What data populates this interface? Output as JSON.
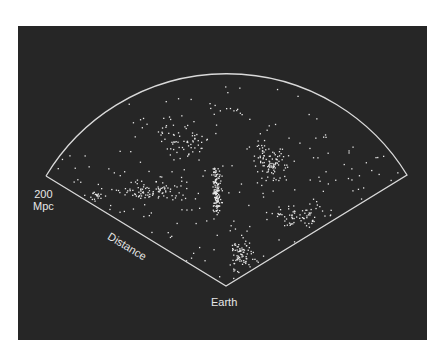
{
  "figure": {
    "background_color": "#262626",
    "outline_color": "#d9d9d9",
    "point_color": "#e8e8e8",
    "labels": {
      "scale_value": "200",
      "scale_unit": "Mpc",
      "axis": "Distance",
      "origin": "Earth"
    },
    "geometry": {
      "apex": [
        226,
        286
      ],
      "left_corner": [
        46,
        176
      ],
      "right_corner": [
        407,
        175
      ],
      "arc_top_y": 68
    },
    "galaxy_distribution": {
      "seed": 12345,
      "background_count": 230,
      "clusters": [
        {
          "cx": 216,
          "cy": 190,
          "sx": 5,
          "sy": 28,
          "n": 140
        },
        {
          "cx": 150,
          "cy": 190,
          "sx": 35,
          "sy": 10,
          "n": 80
        },
        {
          "cx": 270,
          "cy": 160,
          "sx": 20,
          "sy": 22,
          "n": 90
        },
        {
          "cx": 240,
          "cy": 255,
          "sx": 14,
          "sy": 18,
          "n": 70
        },
        {
          "cx": 300,
          "cy": 215,
          "sx": 30,
          "sy": 12,
          "n": 60
        },
        {
          "cx": 185,
          "cy": 140,
          "sx": 30,
          "sy": 20,
          "n": 50
        },
        {
          "cx": 95,
          "cy": 195,
          "sx": 12,
          "sy": 6,
          "n": 20
        }
      ]
    }
  }
}
